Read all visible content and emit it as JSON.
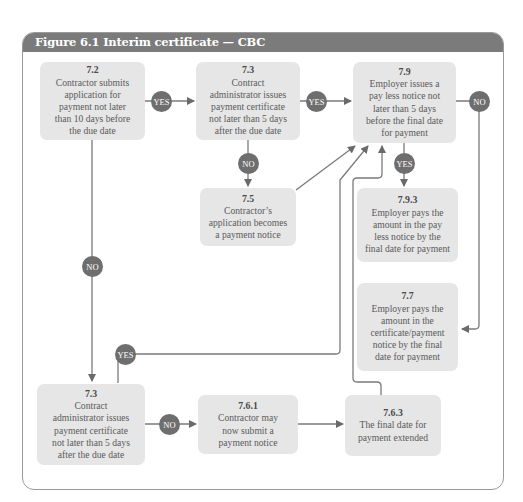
{
  "figure": {
    "title": "Figure 6.1  Interim certificate — CBC",
    "header_color": "#7b7b7b",
    "box_color": "#e6e6e6",
    "badge_color": "#6e6e6e"
  },
  "nodes": [
    {
      "id": "7.2",
      "num": "7.2",
      "lines": [
        "Contractor submits",
        "application for",
        "payment not later",
        "than 10 days before",
        "the due date"
      ]
    },
    {
      "id": "7.3a",
      "num": "7.3",
      "lines": [
        "Contract",
        "administrator issues",
        "payment certificate",
        "not later than 5 days",
        "after the due date"
      ]
    },
    {
      "id": "7.9",
      "num": "7.9",
      "lines": [
        "Employer issues a",
        "pay less notice not",
        "later than 5 days",
        "before the final date",
        "for payment"
      ]
    },
    {
      "id": "7.5",
      "num": "7.5",
      "lines": [
        "Contractor’s",
        "application becomes",
        "a payment notice"
      ]
    },
    {
      "id": "7.9.3",
      "num": "7.9.3",
      "lines": [
        "Employer pays the",
        "amount in the pay",
        "less notice by the",
        "final date for payment"
      ]
    },
    {
      "id": "7.7",
      "num": "7.7",
      "lines": [
        "Employer pays the",
        "amount in the",
        "certificate/payment",
        "notice by the final",
        "date for payment"
      ]
    },
    {
      "id": "7.3b",
      "num": "7.3",
      "lines": [
        "Contract",
        "administrator issues",
        "payment certificate",
        "not later than 5 days",
        "after the due date"
      ]
    },
    {
      "id": "7.6.1",
      "num": "7.6.1",
      "lines": [
        "Contractor may",
        "now submit a",
        "payment notice"
      ]
    },
    {
      "id": "7.6.3",
      "num": "7.6.3",
      "lines": [
        "The final date for",
        "payment extended"
      ]
    }
  ],
  "badges": {
    "yes_7_2_to_7_3": "YES",
    "yes_7_3_to_7_9": "YES",
    "no_7_9_to_7_7": "NO",
    "no_7_3_to_7_5": "NO",
    "yes_7_9_to_7_9_3": "YES",
    "no_7_2_to_7_3b": "NO",
    "yes_7_3b_to_7_9": "YES",
    "no_7_3b_to_7_6_1": "NO"
  },
  "edges": [
    {
      "from": "7.2",
      "to": "7.3a",
      "label": "YES"
    },
    {
      "from": "7.3a",
      "to": "7.9",
      "label": "YES"
    },
    {
      "from": "7.3a",
      "to": "7.5",
      "label": "NO"
    },
    {
      "from": "7.5",
      "to": "7.9",
      "label": ""
    },
    {
      "from": "7.9",
      "to": "7.9.3",
      "label": "YES"
    },
    {
      "from": "7.9",
      "to": "7.7",
      "label": "NO"
    },
    {
      "from": "7.2",
      "to": "7.3b",
      "label": "NO"
    },
    {
      "from": "7.3b",
      "to": "7.9",
      "label": "YES"
    },
    {
      "from": "7.3b",
      "to": "7.6.1",
      "label": "NO"
    },
    {
      "from": "7.6.1",
      "to": "7.6.3",
      "label": ""
    },
    {
      "from": "7.6.3",
      "to": "7.9",
      "label": ""
    }
  ]
}
